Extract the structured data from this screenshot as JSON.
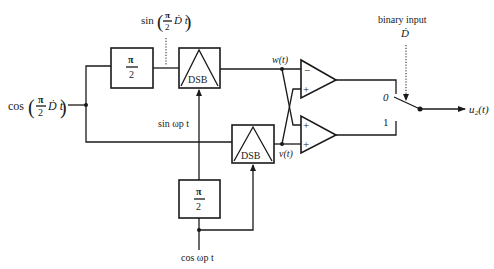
{
  "diagram": {
    "title": "",
    "input": {
      "label_prefix": "cos",
      "frac_num": "π",
      "frac_den": "2",
      "frac_suffix": "Ḋ t"
    },
    "top_annotation": {
      "label_prefix": "sin",
      "frac_num": "π",
      "frac_den": "2",
      "frac_suffix": "Ḋ t"
    },
    "blocks": {
      "top_phase": {
        "num": "π",
        "den": "2"
      },
      "bottom_phase": {
        "num": "π",
        "den": "2"
      },
      "top_dsb": {
        "label": "DSB"
      },
      "bottom_dsb": {
        "label": "DSB"
      }
    },
    "signals": {
      "w": "w(t)",
      "v": "v(t)",
      "sin_carrier": "sin ωp t",
      "cos_carrier": "cos ωp t",
      "output": "u₂(t)"
    },
    "summers": {
      "top": {
        "upper_sign": "−",
        "lower_sign": "+"
      },
      "bottom": {
        "upper_sign": "+",
        "lower_sign": "+"
      }
    },
    "switch": {
      "control_label_line1": "binary input",
      "control_label_line2": "Ḋ",
      "pos0": "0",
      "pos1": "1"
    }
  }
}
